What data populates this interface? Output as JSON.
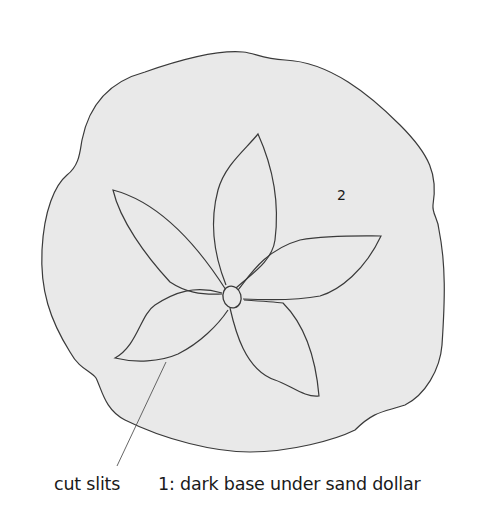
{
  "diagram": {
    "shape_fill": "#e9e9e9",
    "stroke_color": "#3a3a3a",
    "labels": {
      "region_2": "2",
      "cut_slits": "cut slits",
      "region_1": "1: dark base under sand dollar"
    },
    "parts": [
      "outer-body",
      "center-oval",
      "petal-top",
      "petal-upper-left",
      "petal-right",
      "petal-lower-right",
      "petal-lower-left",
      "leader-line"
    ]
  }
}
